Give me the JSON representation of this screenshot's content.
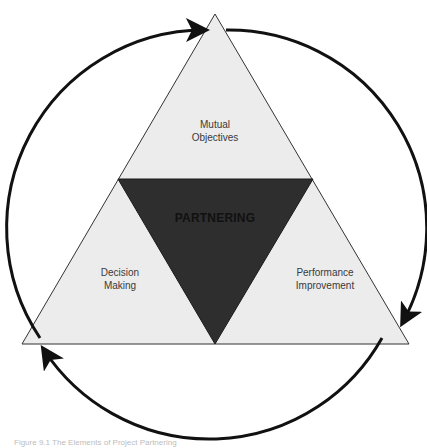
{
  "diagram": {
    "center_label": "PARTNERING",
    "segments": [
      {
        "id": "top",
        "label_line1": "Mutual",
        "label_line2": "Objectives"
      },
      {
        "id": "left",
        "label_line1": "Decision",
        "label_line2": "Making"
      },
      {
        "id": "right",
        "label_line1": "Performance",
        "label_line2": "Improvement"
      }
    ],
    "cycle_direction": "clockwise",
    "colors": {
      "outer_fill": "#ececec",
      "center_fill": "#2e2e2e",
      "stroke": "#111111"
    }
  },
  "caption": "Figure 9.1   The Elements of Project Partnering"
}
